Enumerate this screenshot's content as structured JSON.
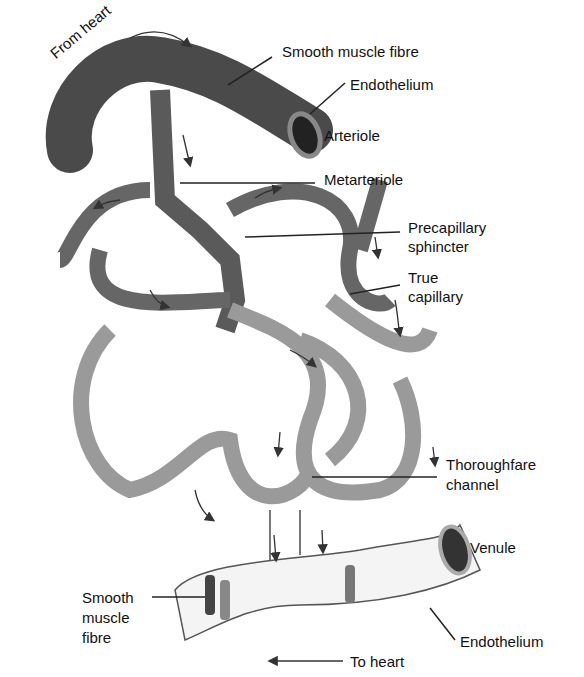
{
  "diagram": {
    "labels": {
      "from_heart": "From heart",
      "smooth_muscle_top": "Smooth muscle fibre",
      "endothelium_top": "Endothelium",
      "arteriole": "Arteriole",
      "metarteriole": "Metarteriole",
      "precapillary_1": "Precapillary",
      "precapillary_2": "sphincter",
      "true_cap_1": "True",
      "true_cap_2": "capillary",
      "thoroughfare_1": "Thoroughfare",
      "thoroughfare_2": "channel",
      "venule": "Venule",
      "smooth_bottom_1": "Smooth",
      "smooth_bottom_2": "muscle",
      "smooth_bottom_3": "fibre",
      "to_heart": "To heart",
      "endothelium_bottom": "Endothelium"
    },
    "colors": {
      "vessel_dark": "#555555",
      "vessel_light": "#a8a8a8",
      "venule": "#f4f4f4",
      "line": "#222222"
    }
  }
}
